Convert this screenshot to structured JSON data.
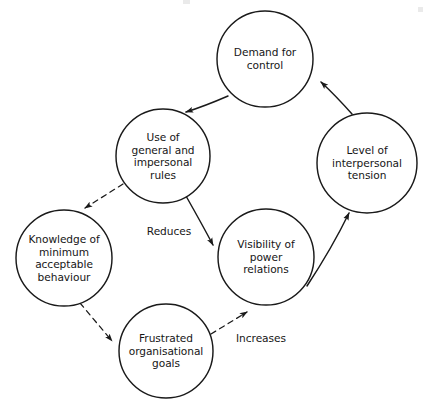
{
  "diagram": {
    "type": "causal-loop-cycle-diagram",
    "background_color": "#ffffff",
    "stroke_color": "#1a1a1a",
    "text_color": "#161616",
    "canvas": {
      "width": 425,
      "height": 412
    },
    "nodes": [
      {
        "id": "demand-for-control",
        "label": "Demand for\ncontrol",
        "cx": 265,
        "cy": 59,
        "r": 48,
        "shape": "circle"
      },
      {
        "id": "use-of-general-and-impersonal-rules",
        "label": "Use of\ngeneral and\nimpersonal\nrules",
        "cx": 163,
        "cy": 156,
        "r": 47,
        "shape": "circle"
      },
      {
        "id": "level-of-interpersonal-tension",
        "label": "Level of\ninterpersonal\ntension",
        "cx": 367,
        "cy": 163,
        "r": 50,
        "shape": "circle"
      },
      {
        "id": "knowledge-of-minimum-acceptable-behaviour",
        "label": "Knowledge of\nminimum\nacceptable\nbehaviour",
        "cx": 64,
        "cy": 258,
        "r": 48,
        "shape": "circle"
      },
      {
        "id": "visibility-of-power-relations",
        "label": "Visibility of\npower\nrelations",
        "cx": 266,
        "cy": 257,
        "r": 48,
        "shape": "circle"
      },
      {
        "id": "frustrated-organisational-goals",
        "label": "Frustrated\norganisational\ngoals",
        "cx": 166,
        "cy": 351,
        "r": 47,
        "shape": "circle"
      }
    ],
    "edges": [
      {
        "id": "demand-to-rules",
        "from": "demand-for-control",
        "to": "use-of-general-and-impersonal-rules",
        "style": "solid",
        "label": "",
        "path": "M 228 96 Q 205 106 186 112",
        "arrow_at": [
          186,
          112
        ],
        "arrow_angle": 160
      },
      {
        "id": "rules-to-visibility",
        "from": "use-of-general-and-impersonal-rules",
        "to": "visibility-of-power-relations",
        "style": "solid",
        "label": "Reduces",
        "label_x": 169,
        "label_y": 231,
        "path": "M 186 196 Q 203 226 213 245",
        "arrow_at": [
          213,
          245
        ],
        "arrow_angle": 62
      },
      {
        "id": "visibility-to-tension",
        "from": "visibility-of-power-relations",
        "to": "level-of-interpersonal-tension",
        "style": "solid",
        "label": "",
        "path": "M 307 286 Q 332 248 349 213",
        "arrow_at": [
          349,
          213
        ],
        "arrow_angle": -64
      },
      {
        "id": "tension-to-demand",
        "from": "level-of-interpersonal-tension",
        "to": "demand-for-control",
        "style": "solid",
        "label": "",
        "path": "M 352 114 Q 336 96 321 82",
        "arrow_at": [
          321,
          82
        ],
        "arrow_angle": -136
      },
      {
        "id": "rules-to-knowledge",
        "from": "use-of-general-and-impersonal-rules",
        "to": "knowledge-of-minimum-acceptable-behaviour",
        "style": "dashed",
        "label": "",
        "path": "M 123 184 L 85 208",
        "arrow_at": [
          85,
          208
        ],
        "arrow_angle": 148
      },
      {
        "id": "knowledge-to-frustrated",
        "from": "knowledge-of-minimum-acceptable-behaviour",
        "to": "frustrated-organisational-goals",
        "style": "dashed",
        "label": "",
        "path": "M 80 303 L 112 341",
        "arrow_at": [
          112,
          341
        ],
        "arrow_angle": 50
      },
      {
        "id": "frustrated-to-visibility",
        "from": "frustrated-organisational-goals",
        "to": "visibility-of-power-relations",
        "style": "dashed",
        "label": "Increases",
        "label_x": 261,
        "label_y": 338,
        "path": "M 211 334 L 247 312",
        "arrow_at": [
          247,
          312
        ],
        "arrow_angle": -31
      }
    ]
  }
}
